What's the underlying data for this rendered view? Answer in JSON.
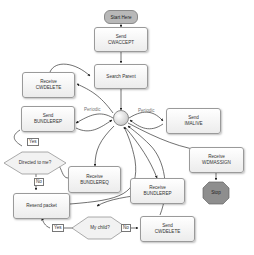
{
  "diagram": {
    "start": "Start Here",
    "nodes": {
      "send_cwaccept": [
        "Send",
        "CWACCEPT"
      ],
      "search_parent": [
        "Search Parent"
      ],
      "receive_cwdelete": [
        "Receive",
        "CWDELETE"
      ],
      "send_bundlerep": [
        "Send",
        "BUNDLEREP"
      ],
      "send_imalive": [
        "Send",
        "IMALIVE"
      ],
      "receive_bundlereq": [
        "Receive",
        "BUNDLEREQ"
      ],
      "receive_bundlerep": [
        "Receive",
        "BUNDLEREP"
      ],
      "receive_wdmassign": [
        "Receive",
        "WDMASSIGN"
      ],
      "resend_packet": [
        "Resend packet"
      ],
      "send_cwdelete": [
        "Send",
        "CWDELETE"
      ]
    },
    "decisions": {
      "directed_to_me": "Directed to me?",
      "my_child": "My child?"
    },
    "edge_labels": {
      "periodic_left": "Periodic",
      "periodic_right": "Periodic",
      "yes_directed": "Yes",
      "no_directed": "No",
      "yes_child": "Yes",
      "no_child": "No"
    },
    "stop": "Stop"
  }
}
